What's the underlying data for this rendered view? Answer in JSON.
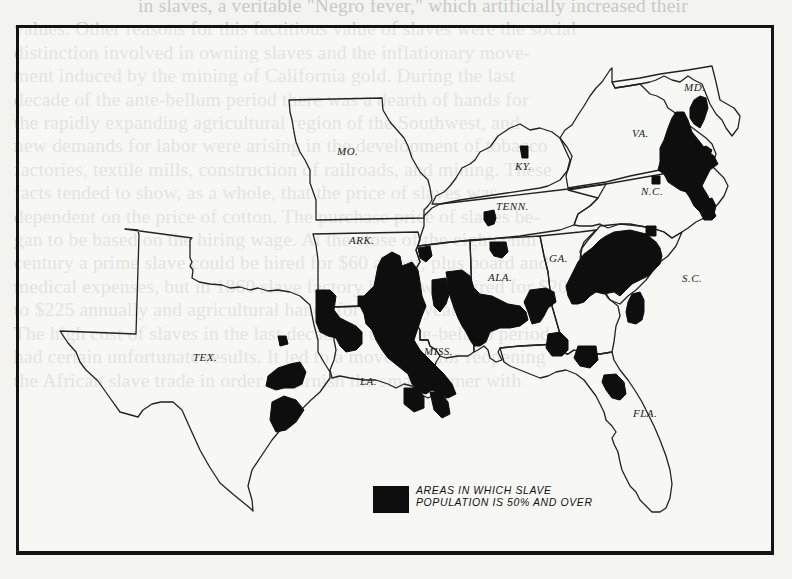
{
  "background_text": {
    "lines": [
      "in slaves, a veritable \"Negro fever,\" which artificially increased their",
      "values. Other reasons for this factitious value of slaves were the social",
      "distinction involved in owning slaves and the inflationary move-",
      "ment induced by the mining of California gold. During the last",
      "decade of the ante-bellum period there was a dearth of hands for",
      "the rapidly expanding agricultural region of the Southwest, and",
      "new demands for labor were arising in the development of tobacco",
      "factories, textile mills, construction of railroads, and mining. These",
      "facts tended to show, as a whole, that the price of slaves was",
      "dependent on the price of cotton. The purchase price of slaves be-",
      "gan to be based on the hiring wage. At the close of the eighteenth",
      "century a prime slave could be hired for $60 a year, plus board and",
      "medical expenses, but in 1860 slave factory hands were hired for $200",
      "to $225 annually and agricultural hands for $150 a year.",
      "The high cost of slaves in the last decade of the ante-bellum period",
      "had certain unfortunate results. It led to a movement for reopening",
      "the African slave trade in order to furnish the small farmer with"
    ]
  },
  "map": {
    "title": "Areas in which slave population is 50% and over",
    "state_labels": [
      {
        "id": "mo",
        "text": "MO.",
        "x": 337,
        "y": 153
      },
      {
        "id": "ky",
        "text": "KY.",
        "x": 516,
        "y": 165
      },
      {
        "id": "md",
        "text": "MD.",
        "x": 684,
        "y": 80
      },
      {
        "id": "va",
        "text": "VA.",
        "x": 632,
        "y": 132
      },
      {
        "id": "nc",
        "text": "N.C.",
        "x": 640,
        "y": 191
      },
      {
        "id": "tenn",
        "text": "TENN.",
        "x": 493,
        "y": 204
      },
      {
        "id": "ark",
        "text": "ARK.",
        "x": 347,
        "y": 235
      },
      {
        "id": "ga",
        "text": "GA.",
        "x": 548,
        "y": 254
      },
      {
        "id": "ala",
        "text": "ALA.",
        "x": 487,
        "y": 270
      },
      {
        "id": "sc",
        "text": "S.C.",
        "x": 681,
        "y": 273
      },
      {
        "id": "tex",
        "text": "TEX.",
        "x": 190,
        "y": 351
      },
      {
        "id": "miss",
        "text": "MISS.",
        "x": 421,
        "y": 345
      },
      {
        "id": "la",
        "text": "LA.",
        "x": 358,
        "y": 375
      },
      {
        "id": "fla",
        "text": "FLA.",
        "x": 632,
        "y": 409
      }
    ],
    "legend": {
      "swatch_color": "#0e0e0e",
      "line1": "AREAS IN WHICH SLAVE",
      "line2": "POPULATION IS 50% AND OVER"
    },
    "colors": {
      "ink": "#0e0e0e",
      "paper": "#f3f3f0",
      "bleed_text": "#c9c9c6"
    }
  }
}
